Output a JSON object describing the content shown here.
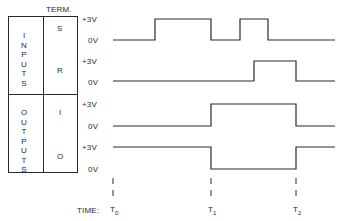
{
  "header": {
    "term_label": "TERM."
  },
  "groups": [
    {
      "label": "INPUTS",
      "terminals": [
        "S",
        "R"
      ]
    },
    {
      "label": "OUTPUTS",
      "terminals": [
        "I",
        "O"
      ]
    }
  ],
  "levels": {
    "high": "+3V",
    "low": "0V"
  },
  "time": {
    "label": "TIME:",
    "markers": [
      {
        "name": "T",
        "sub": "0",
        "x": 113
      },
      {
        "name": "T",
        "sub": "1",
        "x": 211
      },
      {
        "name": "T",
        "sub": "2",
        "x": 296
      }
    ]
  },
  "waveforms": [
    {
      "terminal": "S",
      "high_y": 19,
      "low_y": 40,
      "segments": [
        [
          113,
          "low"
        ],
        [
          155,
          "high"
        ],
        [
          211,
          "low"
        ],
        [
          240,
          "high"
        ],
        [
          268,
          "low"
        ],
        [
          335,
          "low"
        ]
      ]
    },
    {
      "terminal": "R",
      "high_y": 61,
      "low_y": 81,
      "segments": [
        [
          113,
          "low"
        ],
        [
          254,
          "high"
        ],
        [
          296,
          "low"
        ],
        [
          335,
          "low"
        ]
      ]
    },
    {
      "terminal": "I",
      "high_y": 104,
      "low_y": 126,
      "segments": [
        [
          113,
          "low"
        ],
        [
          211,
          "high"
        ],
        [
          296,
          "low"
        ],
        [
          335,
          "low"
        ]
      ]
    },
    {
      "terminal": "O",
      "high_y": 147,
      "low_y": 169,
      "segments": [
        [
          113,
          "high"
        ],
        [
          211,
          "low"
        ],
        [
          296,
          "high"
        ],
        [
          335,
          "high"
        ]
      ]
    }
  ]
}
